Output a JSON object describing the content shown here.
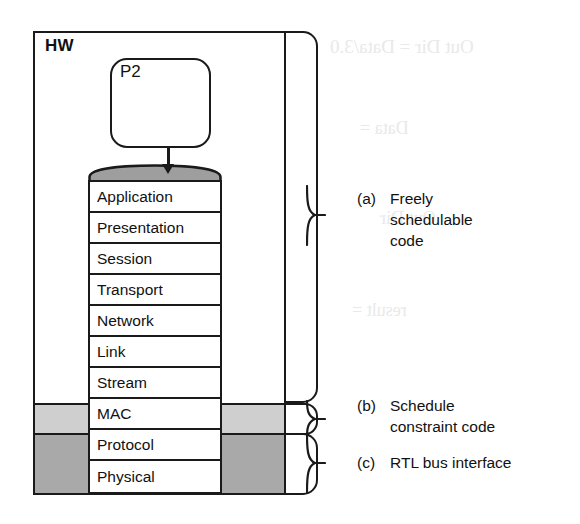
{
  "figure": {
    "hw_block": {
      "label": "HW",
      "process": {
        "label": "P2"
      },
      "stack_layers": [
        {
          "name": "Application",
          "shading": "none"
        },
        {
          "name": "Presentation",
          "shading": "none"
        },
        {
          "name": "Session",
          "shading": "none"
        },
        {
          "name": "Transport",
          "shading": "none"
        },
        {
          "name": "Network",
          "shading": "none"
        },
        {
          "name": "Link",
          "shading": "none"
        },
        {
          "name": "Stream",
          "shading": "none"
        },
        {
          "name": "MAC",
          "shading": "light-gray"
        },
        {
          "name": "Protocol",
          "shading": "dark-gray"
        },
        {
          "name": "Physical",
          "shading": "dark-gray"
        }
      ]
    },
    "annotations": [
      {
        "tag": "(a)",
        "text": "Freely\nschedulable\ncode",
        "covers": "Application through Stream"
      },
      {
        "tag": "(b)",
        "text": "Schedule\nconstraint code",
        "covers": "MAC"
      },
      {
        "tag": "(c)",
        "text": "RTL bus interface",
        "covers": "Protocol and Physical"
      }
    ],
    "colors": {
      "stroke": "#1a1a1a",
      "light_gray_band": "#cfcfcf",
      "dark_gray_band": "#a9a9a9",
      "cylinder_top": "#9e9e9e",
      "background": "#ffffff"
    },
    "bleed_through": [
      "Out Dir = Data/3.0",
      "Data =",
      "result =",
      "Out Dir",
      "DDR ="
    ]
  }
}
